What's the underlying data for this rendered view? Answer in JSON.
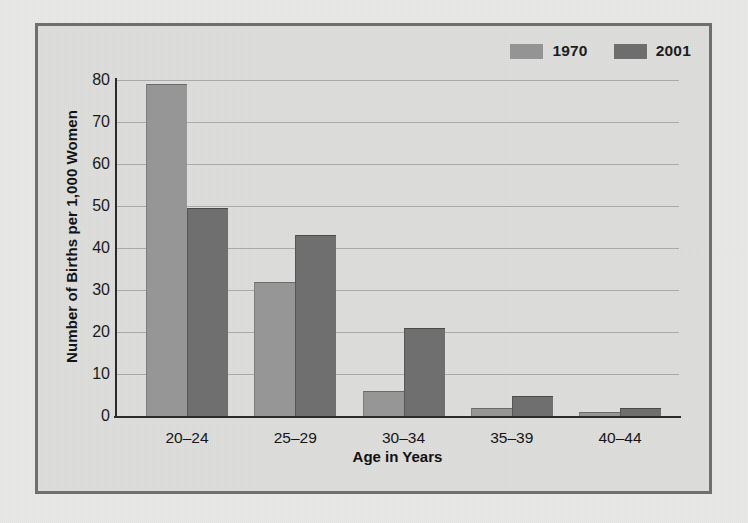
{
  "chart_data": {
    "type": "bar",
    "title": "",
    "xlabel": "Age in Years",
    "ylabel": "Number of Births per 1,000 Women",
    "categories": [
      "20–24",
      "25–29",
      "30–34",
      "35–39",
      "40–44"
    ],
    "series": [
      {
        "name": "1970",
        "color": "#969696",
        "values": [
          79,
          32,
          6,
          2,
          1
        ]
      },
      {
        "name": "2001",
        "color": "#6f6f6f",
        "values": [
          49.5,
          43,
          21,
          4.7,
          2
        ]
      }
    ],
    "ylim": [
      0,
      80
    ],
    "yticks": [
      0,
      10,
      20,
      30,
      40,
      50,
      60,
      70,
      80
    ],
    "ytick_labels": [
      "0",
      "10",
      "20",
      "30",
      "40",
      "50",
      "60",
      "70",
      "80"
    ],
    "grid": true,
    "legend_position": "top-right",
    "legend": [
      "1970",
      "2001"
    ]
  },
  "colors": {
    "series_1970": "#969696",
    "series_2001": "#6f6f6f",
    "frame_border": "#6f6f70",
    "plot_background": "#dededc",
    "page_background": "#e9e9e7",
    "axis": "#2b2b2b",
    "gridline": "#5a5a5a"
  }
}
